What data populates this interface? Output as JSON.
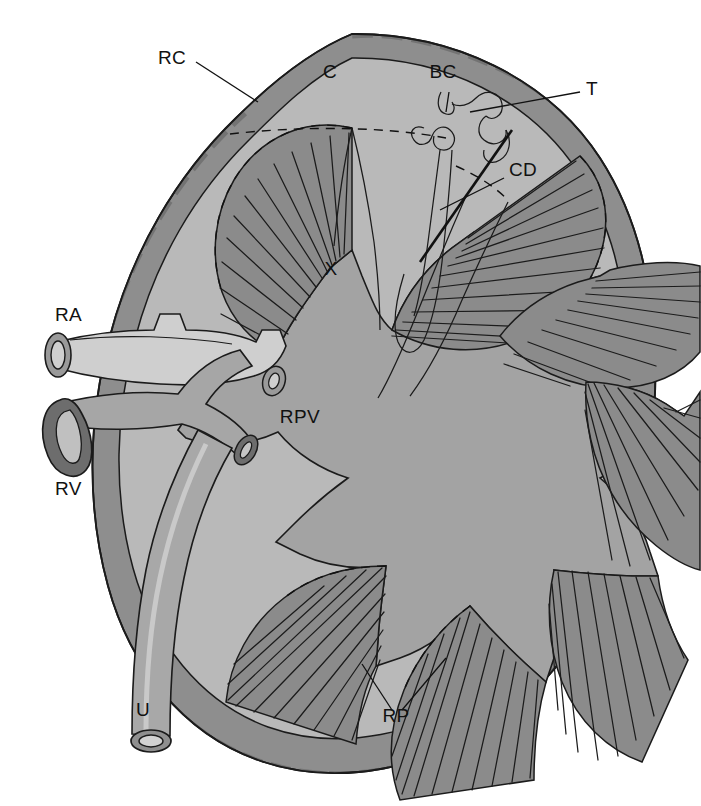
{
  "figure": {
    "type": "anatomical-diagram",
    "organ": "kidney",
    "view": "coronal section",
    "background_color": "#ffffff"
  },
  "palette": {
    "capsule": "#8e8e8e",
    "capsule_shadow": "#6f6f6f",
    "cortex": "#b9b9b9",
    "medulla_pyramid": "#8b8b8b",
    "pelvis": "#a3a3a3",
    "calyx_lumen": "#b9b9b9",
    "artery": "#cfcfcf",
    "vein": "#a6a6a6",
    "vein_wall": "#6d6d6d",
    "ureter": "#a8a8a8",
    "ink": "#1b1b1b",
    "label_text": "#111111"
  },
  "labels": [
    {
      "key": "RC",
      "text": "RC",
      "meaning": "renal capsule",
      "x": 158,
      "y": 64,
      "anchor": "start"
    },
    {
      "key": "C",
      "text": "C",
      "meaning": "cortex",
      "x": 330,
      "y": 78,
      "anchor": "middle"
    },
    {
      "key": "BC",
      "text": "BC",
      "meaning": "Bowman's capsule",
      "x": 443,
      "y": 78,
      "anchor": "middle"
    },
    {
      "key": "T",
      "text": "T",
      "meaning": "tubule",
      "x": 586,
      "y": 95,
      "anchor": "start"
    },
    {
      "key": "CD",
      "text": "CD",
      "meaning": "collecting duct",
      "x": 509,
      "y": 176,
      "anchor": "start"
    },
    {
      "key": "X",
      "text": "X",
      "meaning": "minor calyx",
      "x": 331,
      "y": 275,
      "anchor": "middle"
    },
    {
      "key": "RA",
      "text": "RA",
      "meaning": "renal artery",
      "x": 55,
      "y": 321,
      "anchor": "start"
    },
    {
      "key": "RPV",
      "text": "RPV",
      "meaning": "renal pelvis",
      "x": 300,
      "y": 423,
      "anchor": "middle"
    },
    {
      "key": "RV",
      "text": "RV",
      "meaning": "renal vein",
      "x": 55,
      "y": 495,
      "anchor": "start"
    },
    {
      "key": "U",
      "text": "U",
      "meaning": "ureter",
      "x": 143,
      "y": 716,
      "anchor": "middle"
    },
    {
      "key": "RP",
      "text": "RP",
      "meaning": "renal pyramids",
      "x": 396,
      "y": 722,
      "anchor": "middle"
    }
  ],
  "structures": {
    "capsule": {
      "name": "renal capsule",
      "description": "scalloped outer band"
    },
    "cortex": {
      "name": "cortex",
      "description": "outer light zone"
    },
    "pyramids": {
      "name": "renal pyramids",
      "count": 7,
      "description": "fan-shaped striated medullary wedges"
    },
    "pelvis": {
      "name": "renal pelvis",
      "description": "central branching chamber"
    },
    "calyces": {
      "name": "calyces",
      "count": 7
    },
    "nephron": {
      "name": "nephron",
      "parts": [
        "Bowman's capsule",
        "tubule",
        "loop of Henle",
        "collecting duct"
      ]
    },
    "renal_artery": {
      "name": "renal artery",
      "branches": 2
    },
    "renal_vein": {
      "name": "renal vein",
      "branches": 2
    },
    "ureter": {
      "name": "ureter",
      "description": "tube exiting inferiorly with open lumen"
    }
  }
}
